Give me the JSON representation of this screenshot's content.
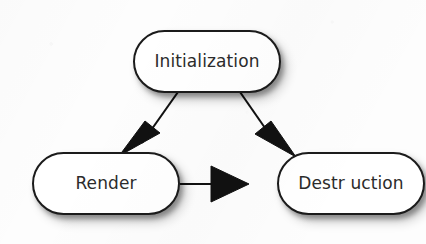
{
  "diagram": {
    "type": "flowchart",
    "background_color": "#fdfdfd",
    "node_fill_color": "#ffffff",
    "node_border_color": "#1b1b1b",
    "label_color": "#2b2b2b",
    "edge_color": "#111111",
    "nodes": [
      {
        "id": "initialization",
        "label": "Initialization",
        "shape": "stadium",
        "position": "top-center"
      },
      {
        "id": "render",
        "label": "Render",
        "shape": "stadium",
        "position": "bottom-left"
      },
      {
        "id": "destruction",
        "label": "Destr uction",
        "shape": "stadium",
        "position": "bottom-right"
      }
    ],
    "edges": [
      {
        "id": "initialization-to-render",
        "from": "Initialization",
        "to": "Render",
        "direction": "down-left",
        "arrowhead": "filled-triangle"
      },
      {
        "id": "initialization-to-destruction",
        "from": "Initialization",
        "to": "Destr uction",
        "direction": "down-right",
        "arrowhead": "filled-triangle"
      },
      {
        "id": "render-to-destruction",
        "from": "Render",
        "to": "Destr uction",
        "direction": "right",
        "arrowhead": "filled-triangle"
      }
    ]
  }
}
